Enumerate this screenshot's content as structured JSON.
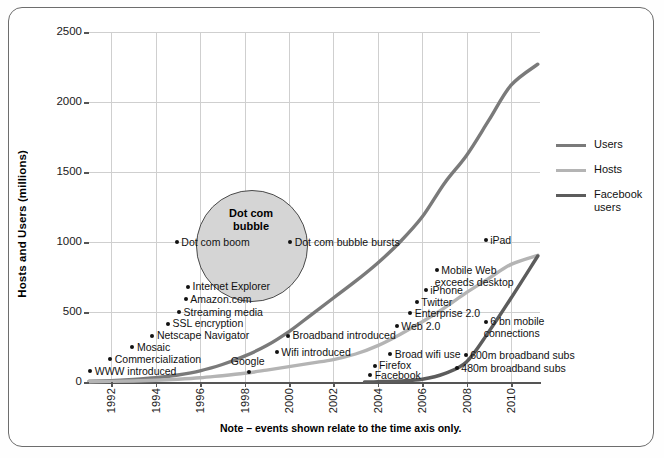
{
  "frame": {
    "note": "Note – events shown relate to the time axis only."
  },
  "legend": {
    "position": "right",
    "items": [
      {
        "label": "Users",
        "color": "#7a7a7a"
      },
      {
        "label": "Hosts",
        "color": "#b4b4b4"
      },
      {
        "label": "Facebook\nusers",
        "color": "#5c5c5c"
      }
    ]
  },
  "bubble": {
    "label": "Dot com\nbubble",
    "fill": "#d5d5d5",
    "stroke": "#4a4a4a"
  },
  "chart_data": {
    "type": "line",
    "title": "",
    "xlabel": "",
    "ylabel": "Hosts and Users (millions)",
    "xlim": [
      1991,
      2011.3
    ],
    "ylim": [
      0,
      2500
    ],
    "yticks": [
      0,
      500,
      1000,
      1500,
      2000,
      2500
    ],
    "xticks": [
      1992,
      1994,
      1996,
      1998,
      2000,
      2002,
      2004,
      2006,
      2008,
      2010
    ],
    "grid": true,
    "series": [
      {
        "name": "Users",
        "color": "#7a7a7a",
        "x": [
          1991,
          1992,
          1993,
          1994,
          1995,
          1996,
          1997,
          1998,
          1999,
          2000,
          2001,
          2002,
          2003,
          2004,
          2005,
          2006,
          2007,
          2008,
          2009,
          2010,
          2011.2
        ],
        "values": [
          5,
          10,
          18,
          30,
          50,
          80,
          125,
          185,
          260,
          360,
          480,
          600,
          720,
          850,
          1000,
          1180,
          1420,
          1620,
          1870,
          2120,
          2270
        ]
      },
      {
        "name": "Hosts",
        "color": "#b4b4b4",
        "x": [
          1991,
          1992,
          1993,
          1994,
          1995,
          1996,
          1997,
          1998,
          1999,
          2000,
          2001,
          2002,
          2003,
          2004,
          2005,
          2006,
          2007,
          2008,
          2009,
          2010,
          2011.2
        ],
        "values": [
          2,
          4,
          7,
          12,
          20,
          30,
          45,
          62,
          85,
          110,
          135,
          160,
          200,
          260,
          340,
          430,
          530,
          640,
          740,
          840,
          905
        ]
      },
      {
        "name": "Facebook users",
        "color": "#5c5c5c",
        "x": [
          2003.4,
          2004,
          2005,
          2006,
          2007,
          2008,
          2009,
          2010,
          2011.2
        ],
        "values": [
          0,
          2,
          8,
          20,
          60,
          145,
          360,
          600,
          900
        ]
      }
    ],
    "annotations": [
      {
        "label": "WWW introduced",
        "x": 1991.1,
        "y": 75,
        "align": "right-of-dot"
      },
      {
        "label": "Commercialization",
        "x": 1992.0,
        "y": 160,
        "align": "right-of-dot"
      },
      {
        "label": "Mosaic",
        "x": 1993.0,
        "y": 245,
        "align": "right-of-dot"
      },
      {
        "label": "Netscape Navigator",
        "x": 1993.9,
        "y": 330,
        "align": "right-of-dot"
      },
      {
        "label": "SSL encryption",
        "x": 1994.6,
        "y": 415,
        "align": "right-of-dot"
      },
      {
        "label": "Streaming media",
        "x": 1995.1,
        "y": 500,
        "align": "right-of-dot"
      },
      {
        "label": "Amazon.com",
        "x": 1995.4,
        "y": 590,
        "align": "right-of-dot"
      },
      {
        "label": "Internet Explorer",
        "x": 1995.5,
        "y": 680,
        "align": "right-of-dot"
      },
      {
        "label": "Dot com boom",
        "x": 1995.0,
        "y": 1000,
        "align": "right-of-dot"
      },
      {
        "label": "Google",
        "x": 1998.1,
        "y": 85,
        "align": "above-dot"
      },
      {
        "label": "Wifi introduced",
        "x": 1999.5,
        "y": 210,
        "align": "right-of-dot"
      },
      {
        "label": "Broadband introduced",
        "x": 2000.0,
        "y": 330,
        "align": "right-of-dot"
      },
      {
        "label": "Dot com bubble bursts",
        "x": 2000.1,
        "y": 1000,
        "align": "right-of-dot"
      },
      {
        "label": "Facebook",
        "x": 2003.7,
        "y": 45,
        "align": "right-of-dot"
      },
      {
        "label": "Firefox",
        "x": 2003.9,
        "y": 115,
        "align": "right-of-dot"
      },
      {
        "label": "Broad wifi use",
        "x": 2004.6,
        "y": 195,
        "align": "right-of-dot"
      },
      {
        "label": "Web 2.0",
        "x": 2004.9,
        "y": 395,
        "align": "right-of-dot"
      },
      {
        "label": "Enterprise 2.0",
        "x": 2005.5,
        "y": 490,
        "align": "right-of-dot"
      },
      {
        "label": "Twitter",
        "x": 2005.8,
        "y": 570,
        "align": "right-of-dot"
      },
      {
        "label": "iPhone",
        "x": 2006.2,
        "y": 655,
        "align": "right-of-dot"
      },
      {
        "label": "Mobile Web\nexceeds desktop",
        "x": 2006.7,
        "y": 795,
        "align": "right-of-dot"
      },
      {
        "label": "iPad",
        "x": 2008.9,
        "y": 1010,
        "align": "right-of-dot"
      },
      {
        "label": "480m broadband subs",
        "x": 2007.6,
        "y": 100,
        "align": "right-of-dot"
      },
      {
        "label": "600m broadband subs",
        "x": 2008.0,
        "y": 190,
        "align": "right-of-dot"
      },
      {
        "label": "6 bn mobile\nconnections",
        "x": 2008.9,
        "y": 430,
        "align": "right-of-dot"
      }
    ]
  }
}
